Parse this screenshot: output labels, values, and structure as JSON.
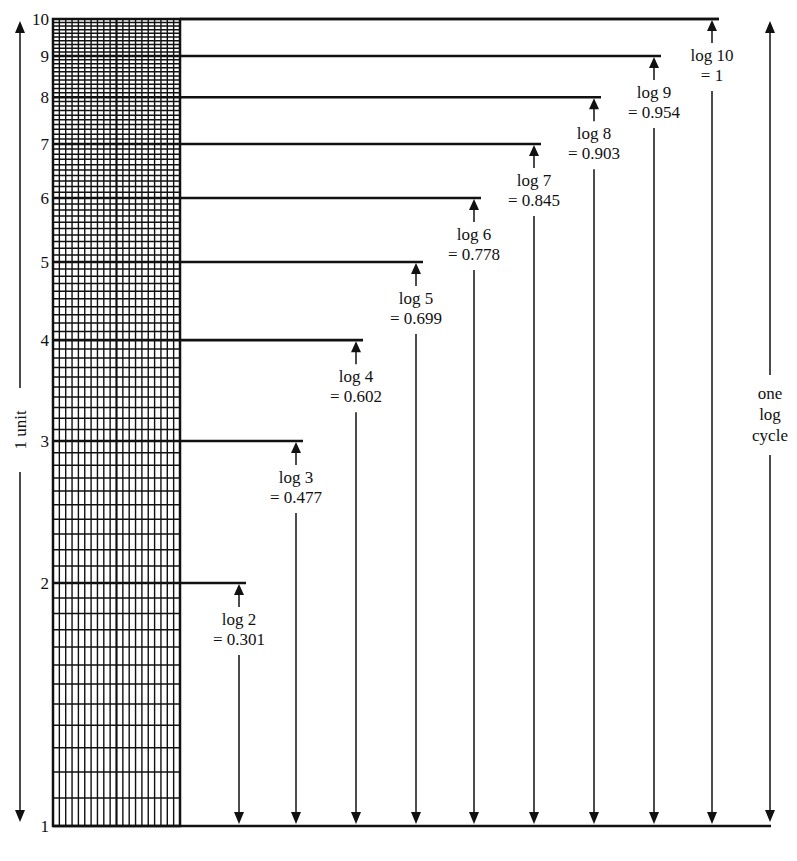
{
  "diagram": {
    "colors": {
      "ink": "#111111",
      "background": "#ffffff"
    },
    "axis_left_label": "1 unit",
    "axis_right_label_lines": [
      "one",
      "log",
      "cycle"
    ],
    "tick_labels": [
      "1",
      "2",
      "3",
      "4",
      "5",
      "6",
      "7",
      "8",
      "9",
      "10"
    ],
    "annotations": [
      {
        "value": 2,
        "line1": "log 2",
        "line2": "= 0.301"
      },
      {
        "value": 3,
        "line1": "log 3",
        "line2": "= 0.477"
      },
      {
        "value": 4,
        "line1": "log 4",
        "line2": "= 0.602"
      },
      {
        "value": 5,
        "line1": "log 5",
        "line2": "= 0.699"
      },
      {
        "value": 6,
        "line1": "log 6",
        "line2": "= 0.778"
      },
      {
        "value": 7,
        "line1": "log 7",
        "line2": "= 0.845"
      },
      {
        "value": 8,
        "line1": "log 8",
        "line2": "= 0.903"
      },
      {
        "value": 9,
        "line1": "log 9",
        "line2": "= 0.954"
      },
      {
        "value": 10,
        "line1": "log 10",
        "line2": "= 1"
      }
    ]
  },
  "chart_data": {
    "type": "table",
    "x": [
      1,
      2,
      3,
      4,
      5,
      6,
      7,
      8,
      9,
      10
    ],
    "values": [
      0,
      0.301,
      0.477,
      0.602,
      0.699,
      0.778,
      0.845,
      0.903,
      0.954,
      1
    ],
    "xlabel": "",
    "ylabel": "1 unit",
    "yscale": "log",
    "ylim": [
      1,
      10
    ],
    "annotations": [
      "one log cycle",
      "1 unit"
    ]
  }
}
